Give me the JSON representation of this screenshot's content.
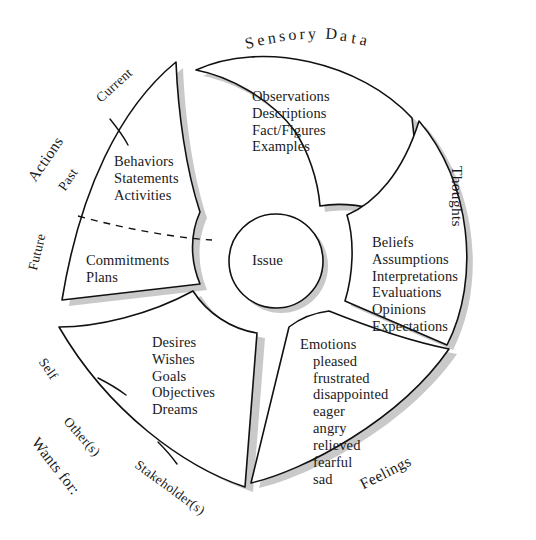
{
  "diagram": {
    "hub": {
      "label": "Issue"
    },
    "colors": {
      "stroke": "#111111",
      "shadow": "#c9c9c9",
      "background": "#ffffff",
      "text": "#1a1a1a"
    },
    "petals": [
      {
        "id": "sensory-data",
        "category": "Sensory Data",
        "items": [
          "Observations",
          "Descriptions",
          "Fact/Figures",
          "Examples"
        ]
      },
      {
        "id": "thoughts",
        "category": "Thoughts",
        "items": [
          "Beliefs",
          "Assumptions",
          "Interpretations",
          "Evaluations",
          "Opinions",
          "Expectations"
        ]
      },
      {
        "id": "feelings",
        "category": "Feelings",
        "items": [
          "Emotions",
          "pleased",
          "frustrated",
          "disappointed",
          "eager",
          "angry",
          "relieved",
          "fearful",
          "sad"
        ],
        "heading": "Emotions",
        "sub_items": [
          "pleased",
          "frustrated",
          "disappointed",
          "eager",
          "angry",
          "relieved",
          "fearful",
          "sad"
        ]
      },
      {
        "id": "wants-for",
        "category": "Wants for:",
        "sub_labels": [
          "Self",
          "Other(s)",
          "Stakeholder(s)"
        ],
        "items": [
          "Desires",
          "Wishes",
          "Goals",
          "Objectives",
          "Dreams"
        ]
      },
      {
        "id": "actions",
        "category": "Actions",
        "sub_labels": [
          "Current",
          "Past",
          "Future"
        ],
        "items_upper": [
          "Behaviors",
          "Statements",
          "Activities"
        ],
        "items_lower": [
          "Commitments",
          "Plans"
        ]
      }
    ]
  },
  "labels": {
    "sensory_data": "Sensory Data",
    "thoughts": "Thoughts",
    "feelings": "Feelings",
    "actions": "Actions",
    "wants_for": "Wants for:",
    "current": "Current",
    "past": "Past",
    "future": "Future",
    "self": "Self",
    "others": "Other(s)",
    "stakeholders": "Stakeholder(s)",
    "issue": "Issue"
  },
  "lists": {
    "sensory": {
      "l0": "Observations",
      "l1": "Descriptions",
      "l2": "Fact/Figures",
      "l3": "Examples"
    },
    "thoughts": {
      "l0": "Beliefs",
      "l1": "Assumptions",
      "l2": "Interpretations",
      "l3": "Evaluations",
      "l4": "Opinions",
      "l5": "Expectations"
    },
    "feelings": {
      "h": "Emotions",
      "l0": "pleased",
      "l1": "frustrated",
      "l2": "disappointed",
      "l3": "eager",
      "l4": "angry",
      "l5": "relieved",
      "l6": "fearful",
      "l7": "sad"
    },
    "wants": {
      "l0": "Desires",
      "l1": "Wishes",
      "l2": "Goals",
      "l3": "Objectives",
      "l4": "Dreams"
    },
    "actions_upper": {
      "l0": "Behaviors",
      "l1": "Statements",
      "l2": "Activities"
    },
    "actions_lower": {
      "l0": "Commitments",
      "l1": "Plans"
    }
  }
}
